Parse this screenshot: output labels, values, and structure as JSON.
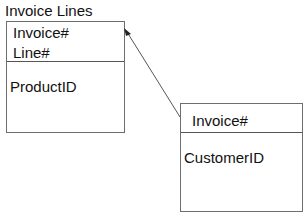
{
  "diagram": {
    "entities": [
      {
        "title": "Invoice Lines",
        "key_fields": [
          "Invoice#",
          "Line#"
        ],
        "attribute_fields": [
          "ProductID"
        ]
      },
      {
        "title": "",
        "key_fields": [
          "Invoice#"
        ],
        "attribute_fields": [
          "CustomerID"
        ]
      }
    ],
    "relationships": [
      {
        "from": "entity-2",
        "to": "entity-1",
        "style": "arrow"
      }
    ],
    "colors": {
      "line": "#555555",
      "background": "#ffffff",
      "text": "#111111"
    }
  }
}
